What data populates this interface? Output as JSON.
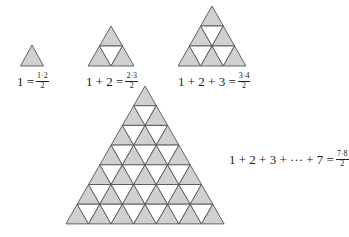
{
  "figure": {
    "colors": {
      "shaded": "#d0d0d0",
      "unshaded": "#ffffff",
      "stroke": "#555555"
    },
    "triangles": [
      {
        "n": 1,
        "apex": [
          32,
          45
        ],
        "row_height": 21,
        "half_width": 11.5
      },
      {
        "n": 2,
        "apex": [
          111,
          26
        ],
        "row_height": 20,
        "half_width": 11.5
      },
      {
        "n": 3,
        "apex": [
          212,
          6
        ],
        "row_height": 20,
        "half_width": 11.3
      },
      {
        "n": 7,
        "apex": [
          145,
          86
        ],
        "row_height": 19.7,
        "half_width": 11.3
      }
    ]
  },
  "formulas": [
    {
      "lhs": "1 = ",
      "num": "1·2",
      "den": "2"
    },
    {
      "lhs": "1 + 2 = ",
      "num": "2·3",
      "den": "2"
    },
    {
      "lhs": "1 + 2 + 3 = ",
      "num": "3·4",
      "den": "2"
    },
    {
      "lhs": "1 + 2 + 3 + ··· + 7 = ",
      "num": "7·8",
      "den": "2"
    }
  ]
}
